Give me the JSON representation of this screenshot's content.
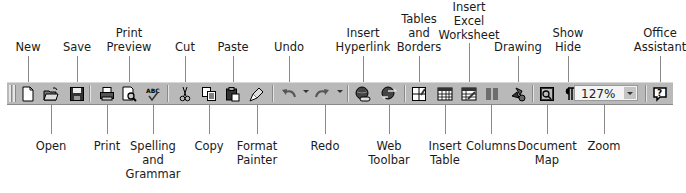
{
  "toolbar": {
    "name": "Standard Toolbar",
    "zoom_value": "127%",
    "buttons": [
      {
        "id": "new",
        "label": "New",
        "icon": "new-document-icon"
      },
      {
        "id": "open",
        "label": "Open",
        "icon": "open-folder-icon"
      },
      {
        "id": "save",
        "label": "Save",
        "icon": "floppy-disk-icon"
      },
      {
        "id": "print",
        "label": "Print",
        "icon": "printer-icon"
      },
      {
        "id": "print-preview",
        "label": "Print Preview",
        "icon": "print-preview-icon"
      },
      {
        "id": "spelling",
        "label": "Spelling and Grammar",
        "icon": "spell-check-icon"
      },
      {
        "id": "cut",
        "label": "Cut",
        "icon": "scissors-icon"
      },
      {
        "id": "copy",
        "label": "Copy",
        "icon": "copy-icon"
      },
      {
        "id": "paste",
        "label": "Paste",
        "icon": "clipboard-icon"
      },
      {
        "id": "format-painter",
        "label": "Format Painter",
        "icon": "paintbrush-icon"
      },
      {
        "id": "undo",
        "label": "Undo",
        "icon": "undo-arrow-icon"
      },
      {
        "id": "redo",
        "label": "Redo",
        "icon": "redo-arrow-icon"
      },
      {
        "id": "insert-hyperlink",
        "label": "Insert Hyperlink",
        "icon": "globe-link-icon"
      },
      {
        "id": "web-toolbar",
        "label": "Web Toolbar",
        "icon": "globe-arrows-icon"
      },
      {
        "id": "tables-borders",
        "label": "Tables and Borders",
        "icon": "table-pencil-icon"
      },
      {
        "id": "insert-table",
        "label": "Insert Table",
        "icon": "table-grid-icon"
      },
      {
        "id": "insert-excel",
        "label": "Insert Excel Worksheet",
        "icon": "spreadsheet-icon"
      },
      {
        "id": "columns",
        "label": "Columns",
        "icon": "columns-icon"
      },
      {
        "id": "drawing",
        "label": "Drawing",
        "icon": "drawing-shapes-icon"
      },
      {
        "id": "document-map",
        "label": "Document Map",
        "icon": "document-map-icon"
      },
      {
        "id": "show-hide",
        "label": "Show Hide",
        "icon": "pilcrow-icon"
      },
      {
        "id": "zoom",
        "label": "Zoom",
        "icon": "zoom-dropdown"
      },
      {
        "id": "office-assistant",
        "label": "Office Assistant",
        "icon": "help-question-icon"
      }
    ]
  },
  "callouts": {
    "top": [
      {
        "lines": [
          "New"
        ],
        "x": 28
      },
      {
        "lines": [
          "Save"
        ],
        "x": 77
      },
      {
        "lines": [
          "Print",
          "Preview"
        ],
        "x": 129
      },
      {
        "lines": [
          "Cut"
        ],
        "x": 185
      },
      {
        "lines": [
          "Paste"
        ],
        "x": 233
      },
      {
        "lines": [
          "Undo"
        ],
        "x": 289
      },
      {
        "lines": [
          "Insert",
          "Hyperlink"
        ],
        "x": 363
      },
      {
        "lines": [
          "Tables",
          "and",
          "Borders"
        ],
        "x": 419
      },
      {
        "lines": [
          "Insert",
          "Excel",
          "Worksheet"
        ],
        "x": 469
      },
      {
        "lines": [
          "Drawing"
        ],
        "x": 518
      },
      {
        "lines": [
          "Show",
          "Hide"
        ],
        "x": 568
      },
      {
        "lines": [
          "Office",
          "Assistant"
        ],
        "x": 660
      }
    ],
    "bottom": [
      {
        "lines": [
          "Open"
        ],
        "x": 51
      },
      {
        "lines": [
          "Print"
        ],
        "x": 107
      },
      {
        "lines": [
          "Spelling",
          "and",
          "Grammar"
        ],
        "x": 153
      },
      {
        "lines": [
          "Copy"
        ],
        "x": 209
      },
      {
        "lines": [
          "Format",
          "Painter"
        ],
        "x": 257
      },
      {
        "lines": [
          "Redo"
        ],
        "x": 325
      },
      {
        "lines": [
          "Web",
          "Toolbar"
        ],
        "x": 389
      },
      {
        "lines": [
          "Insert",
          "Table"
        ],
        "x": 445
      },
      {
        "lines": [
          "Columns"
        ],
        "x": 491
      },
      {
        "lines": [
          "Document",
          "Map"
        ],
        "x": 547
      },
      {
        "lines": [
          "Zoom"
        ],
        "x": 604
      }
    ]
  },
  "colors": {
    "toolbar_bg": "#b9b9b9",
    "leader_line": "#8a8a8a",
    "text": "#1a1a1a"
  }
}
